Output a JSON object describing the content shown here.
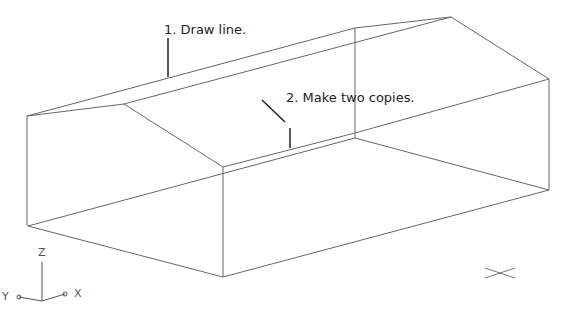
{
  "annotations": {
    "step1": "1. Draw line.",
    "step2": "2. Make two copies."
  },
  "ucs_icon": {
    "z_label": "Z",
    "y_label": "Y",
    "x_label": "X"
  },
  "colors": {
    "line": "#666666",
    "leader": "#222222",
    "text": "#222222"
  }
}
